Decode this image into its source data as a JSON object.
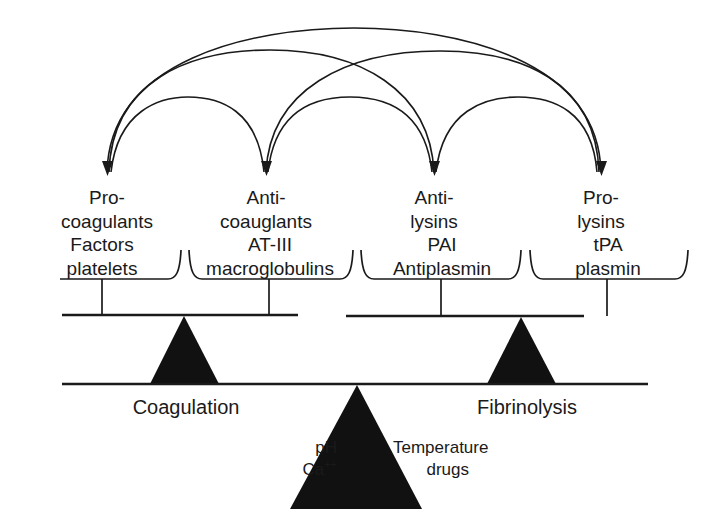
{
  "categories": [
    {
      "line1": "Pro-",
      "line2": "coagulants"
    },
    {
      "line1": "Anti-",
      "line2": "coauglants"
    },
    {
      "line1": "Anti-",
      "line2": "lysins"
    },
    {
      "line1": "Pro-",
      "line2": "lysins"
    }
  ],
  "substances": [
    {
      "line1": "Factors",
      "line2": "platelets"
    },
    {
      "line1": "AT-III",
      "line2": "macroglobulins"
    },
    {
      "line1": "PAI",
      "line2": "Antiplasmin"
    },
    {
      "line1": "tPA",
      "line2": "plasmin"
    }
  ],
  "balances": {
    "left": "Coagulation",
    "right": "Fibrinolysis"
  },
  "modifiers": {
    "left": {
      "line1": "pH",
      "line2_base": "Ca",
      "line2_sup": "++"
    },
    "right": {
      "line1": "Temperature",
      "line2": "drugs"
    }
  },
  "colors": {
    "ink": "#1a1a1a",
    "background": "#ffffff"
  }
}
